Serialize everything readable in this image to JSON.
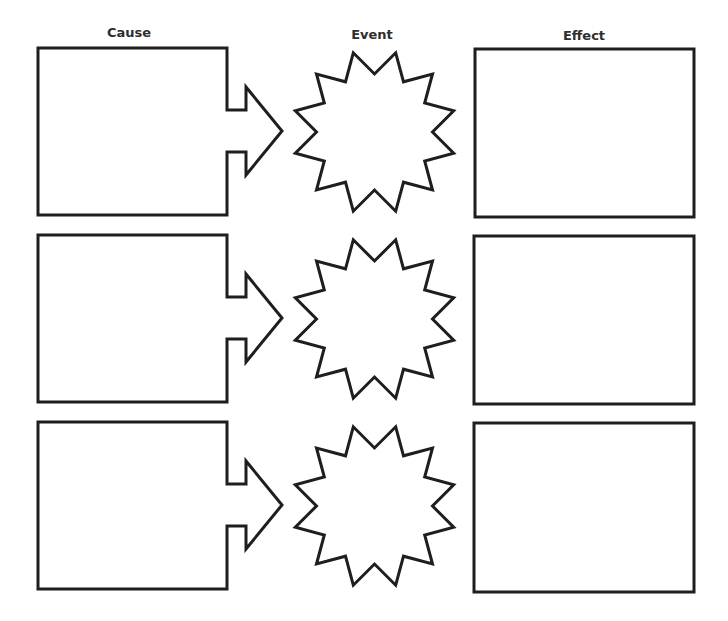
{
  "diagram": {
    "headers": {
      "cause": "Cause",
      "event": "Event",
      "effect": "Effect"
    },
    "rows": [
      {
        "cause": "",
        "event": "",
        "effect": ""
      },
      {
        "cause": "",
        "event": "",
        "effect": ""
      },
      {
        "cause": "",
        "event": "",
        "effect": ""
      }
    ],
    "colors": {
      "stroke": "#1e1e1e",
      "fill": "#ffffff",
      "label": "#2e2e2e"
    },
    "shapes": {
      "cause": "box-with-arrow",
      "event": "12-point-star-burst",
      "effect": "rectangle"
    }
  }
}
